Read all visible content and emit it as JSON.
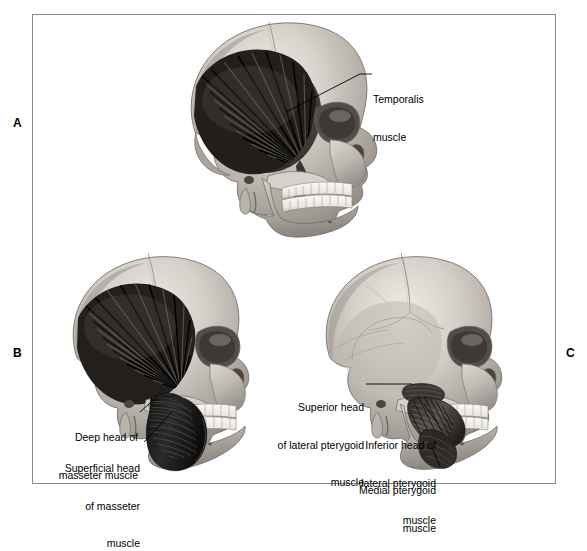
{
  "figure": {
    "background_color": "#ffffff",
    "frame_color": "#8a8a8a",
    "panels": [
      {
        "id": "A",
        "letter": "A",
        "subject": "lateral skull with temporalis muscle",
        "labels": [
          {
            "id": "temporalis",
            "lines": [
              "Temporalis",
              "muscle"
            ],
            "align": "left"
          }
        ]
      },
      {
        "id": "B",
        "letter": "B",
        "subject": "lateral skull with temporalis and masseter muscle heads",
        "labels": [
          {
            "id": "deep-head-masseter",
            "lines": [
              "Deep head of",
              "masseter muscle"
            ],
            "align": "right"
          },
          {
            "id": "superficial-head-masseter",
            "lines": [
              "Superficial head",
              "of masseter",
              "muscle"
            ],
            "align": "right"
          }
        ]
      },
      {
        "id": "C",
        "letter": "C",
        "subject": "lateral skull with lateral and medial pterygoid muscles",
        "labels": [
          {
            "id": "superior-head-lateral-pterygoid",
            "lines": [
              "Superior head",
              "of lateral pterygoid",
              "muscle"
            ],
            "align": "right"
          },
          {
            "id": "inferior-head-lateral-pterygoid",
            "lines": [
              "Inferior head of",
              "lateral pterygoid",
              "muscle"
            ],
            "align": "right"
          },
          {
            "id": "medial-pterygoid",
            "lines": [
              "Medial pterygoid",
              "muscle"
            ],
            "align": "right"
          }
        ]
      }
    ],
    "colors": {
      "bone_light": "#e6e2dc",
      "bone_mid": "#b5b0a9",
      "bone_dark": "#8d8882",
      "bone_shadow": "#6a655f",
      "muscle_dark": "#1a1a1a",
      "muscle_mid": "#3a3a3a",
      "tooth": "#f4f2ee",
      "leader_line": "#000000",
      "text": "#000000"
    }
  }
}
